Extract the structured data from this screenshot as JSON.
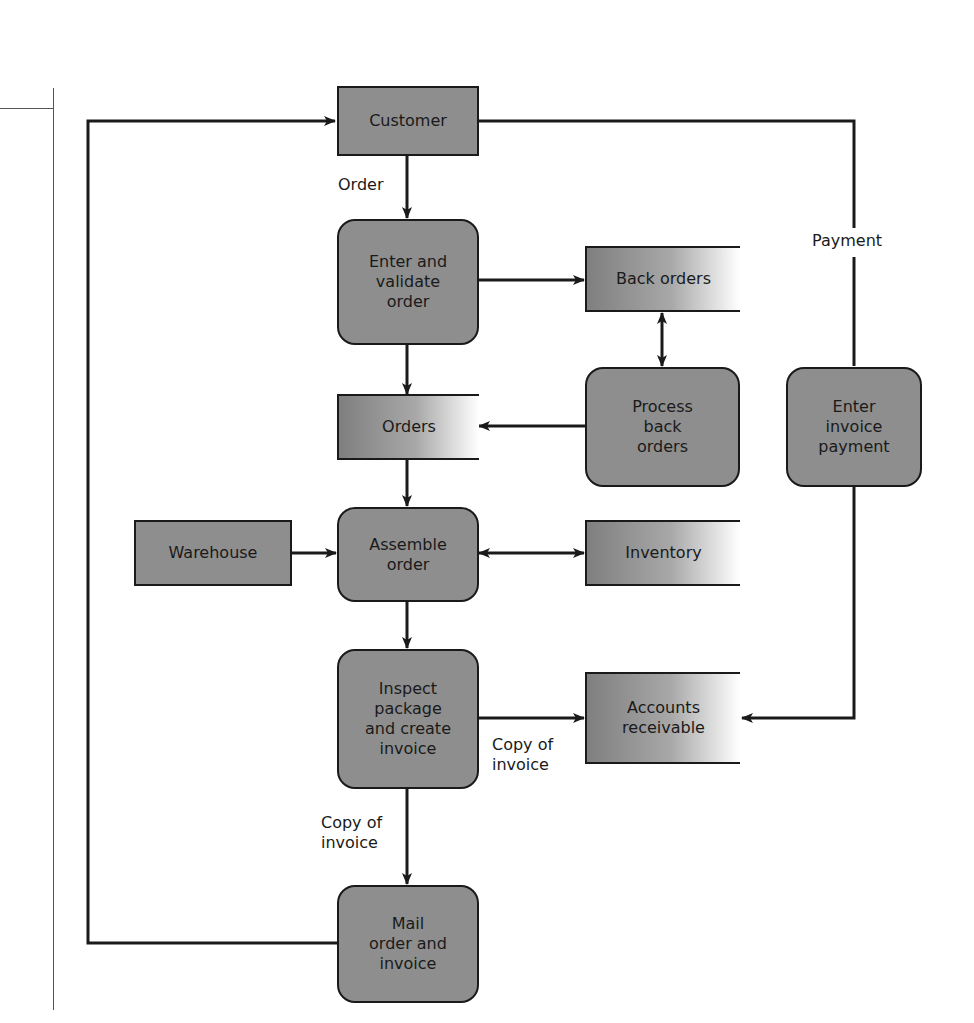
{
  "diagram": {
    "type": "data-flow-diagram",
    "colors": {
      "node_fill": "#8e8e8e",
      "border": "#1a1a1a",
      "line": "#1a1a1a",
      "background": "#ffffff"
    },
    "externals": {
      "customer": "Customer",
      "warehouse": "Warehouse"
    },
    "processes": {
      "enter_validate": "Enter and\nvalidate\norder",
      "process_back_orders": "Process\nback\norders",
      "enter_invoice_payment": "Enter\ninvoice\npayment",
      "assemble_order": "Assemble\norder",
      "inspect_package": "Inspect\npackage\nand create\ninvoice",
      "mail_order": "Mail\norder and\ninvoice"
    },
    "stores": {
      "back_orders": "Back orders",
      "orders": "Orders",
      "inventory": "Inventory",
      "accounts_receivable": "Accounts\nreceivable"
    },
    "flow_labels": {
      "order": "Order",
      "payment": "Payment",
      "copy_of_invoice_right": "Copy of\ninvoice",
      "copy_of_invoice_down": "Copy of\ninvoice"
    }
  }
}
